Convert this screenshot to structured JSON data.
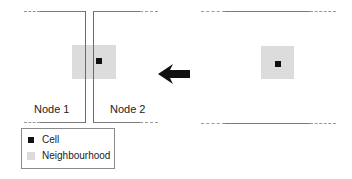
{
  "diagram": {
    "nodes": [
      {
        "label": "Node 1"
      },
      {
        "label": "Node 2"
      }
    ],
    "arrow": {
      "direction": "left"
    },
    "legend": {
      "items": [
        {
          "label": "Cell",
          "color": "#111111"
        },
        {
          "label": "Neighbourhood",
          "color": "#dcdcdc"
        }
      ]
    },
    "colors": {
      "cell": "#111111",
      "neighbourhood": "#dcdcdc",
      "border": "#7a7a7a"
    }
  }
}
